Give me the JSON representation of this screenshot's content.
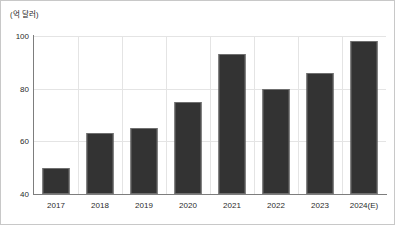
{
  "chart_data": {
    "type": "bar",
    "title": "",
    "subtitle": "",
    "unit_label": "(억 달러)",
    "xlabel": "",
    "ylabel": "",
    "categories": [
      "2017",
      "2018",
      "2019",
      "2020",
      "2021",
      "2022",
      "2023",
      "2024(E)"
    ],
    "values": [
      50,
      63,
      65,
      75,
      93,
      80,
      86,
      98
    ],
    "series": [
      {
        "name": "",
        "values": [
          50,
          63,
          65,
          75,
          93,
          80,
          86,
          98
        ]
      }
    ],
    "ylim": [
      40,
      100
    ],
    "yticks": [
      40,
      60,
      80,
      100
    ],
    "ytick_labels": [
      "40",
      "60",
      "80",
      "100"
    ],
    "grid": true,
    "legend": false,
    "legend_position": "none",
    "bar_color": "#333333",
    "bar_border_color": "#6f6f6f",
    "gridline_color": "#e4e4e4",
    "axis_color": "#7d7d7d",
    "frame_color": "#c8c8c8",
    "background_color": "#ffffff",
    "text_color": "#2b2b2b"
  }
}
